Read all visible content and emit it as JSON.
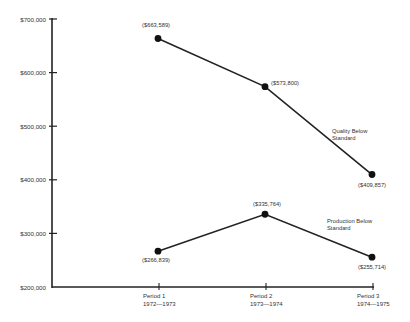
{
  "chart_data": {
    "type": "line",
    "title": "",
    "xlabel": "",
    "ylabel": "",
    "ylim": [
      200000,
      700000
    ],
    "grid": false,
    "legend_position": "inline-right",
    "categories": [
      {
        "label": "Period 1",
        "sub": "1972—1973"
      },
      {
        "label": "Period 2",
        "sub": "1973—1974"
      },
      {
        "label": "Period 3",
        "sub": "1974—1975"
      }
    ],
    "y_ticks": [
      {
        "value": 700000,
        "label": "$700,000"
      },
      {
        "value": 600000,
        "label": "$600,000"
      },
      {
        "value": 500000,
        "label": "$500,000"
      },
      {
        "value": 400000,
        "label": "$400,000"
      },
      {
        "value": 300000,
        "label": "$300,000"
      },
      {
        "value": 200000,
        "label": "$200,000"
      }
    ],
    "series": [
      {
        "name": "Quality Below Standard",
        "name_lines": [
          "Quality Below",
          "Standard"
        ],
        "values": [
          663589,
          573800,
          409857
        ],
        "labels": [
          "($663,589)",
          "($573,800)",
          "($409,857)"
        ]
      },
      {
        "name": "Production Below Standard",
        "name_lines": [
          "Production Below",
          "Standard"
        ],
        "values": [
          266839,
          335764,
          255714
        ],
        "labels": [
          "($266,839)",
          "($335,764)",
          "($255,714)"
        ]
      }
    ]
  },
  "colors": {
    "line": "#222222",
    "text": "#333333",
    "background": "#ffffff"
  }
}
